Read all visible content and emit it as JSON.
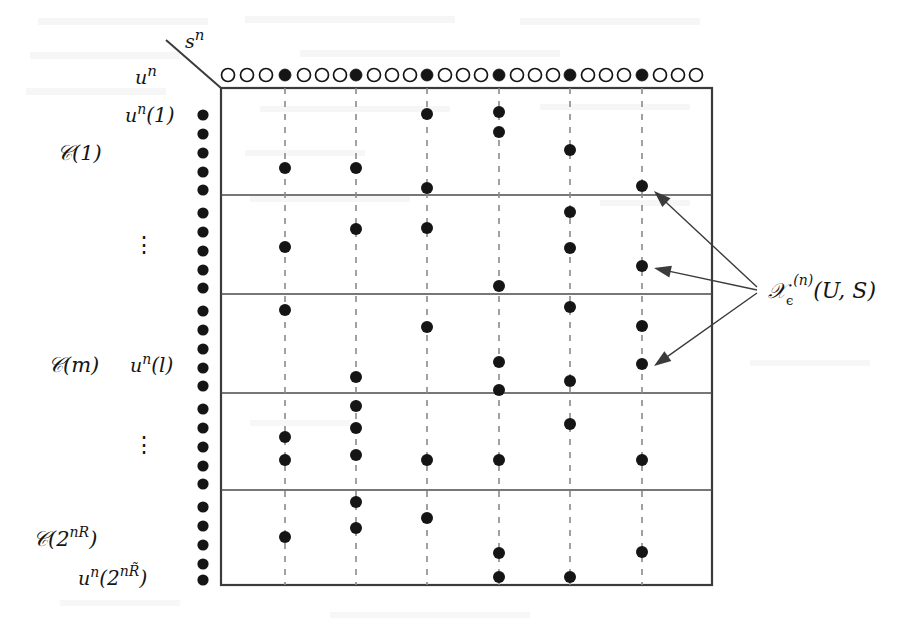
{
  "figure": {
    "axis_labels": {
      "horizontal": "s^n",
      "vertical": "u^n"
    },
    "row_labels": [
      {
        "id": "un-1",
        "text": "uⁿ(1)",
        "base": "u",
        "sup": "n",
        "arg": "(1)"
      },
      {
        "id": "c-1",
        "text": "𝒞(1)",
        "base": "C",
        "arg": "(1)"
      },
      {
        "id": "vdots-upper",
        "text": "⋮"
      },
      {
        "id": "c-m",
        "text": "𝒞(m)",
        "base": "C",
        "arg": "(m)"
      },
      {
        "id": "un-l",
        "text": "uⁿ(l)",
        "base": "u",
        "sup": "n",
        "arg": "(l)"
      },
      {
        "id": "vdots-lower",
        "text": "⋮"
      },
      {
        "id": "c-2nR",
        "text": "𝒞(2ⁿᴿ)",
        "base": "C",
        "arg": "(2^{nR})"
      },
      {
        "id": "un-2nRtilde",
        "text": "uⁿ(2ⁿᴿ̃)",
        "base": "u",
        "sup": "n",
        "arg": "(2^{nR̃})"
      }
    ],
    "annotation": {
      "id": "typical-set-label",
      "text": "𝒣ₑ⁽ⁿ⁾(U, S)",
      "symbol": "T",
      "subscript": "ϵ",
      "superscript": "(n)",
      "args": "(U, S)",
      "arrow_count": 3
    },
    "colors": {
      "ink": "#151515",
      "line": "#3b3b3b",
      "dashed": "#8a8a8a",
      "background": "#ffffff",
      "dot_fill": "#151515",
      "open_fill": "#ffffff"
    },
    "geometry": {
      "box": {
        "x": 221,
        "y": 88,
        "width": 491,
        "height": 497
      },
      "band_separators_y": [
        195,
        294,
        393,
        490
      ],
      "dashed_columns_x": [
        285,
        356,
        427,
        499,
        570,
        642
      ],
      "left_column_x": 203,
      "left_column_rows": 25,
      "top_row_y": 75,
      "top_row_count": 24,
      "top_row_pattern": "3 open then 1 filled, repeating",
      "dot_radius": 6,
      "open_radius": 6.5,
      "arrow_hub": {
        "x": 757,
        "y": 290
      }
    },
    "top_row_circles": [
      {
        "x": 228,
        "filled": false
      },
      {
        "x": 247,
        "filled": false
      },
      {
        "x": 266,
        "filled": false
      },
      {
        "x": 285,
        "filled": true
      },
      {
        "x": 304,
        "filled": false
      },
      {
        "x": 322,
        "filled": false
      },
      {
        "x": 340,
        "filled": false
      },
      {
        "x": 356,
        "filled": true
      },
      {
        "x": 374,
        "filled": false
      },
      {
        "x": 392,
        "filled": false
      },
      {
        "x": 410,
        "filled": false
      },
      {
        "x": 427,
        "filled": true
      },
      {
        "x": 445,
        "filled": false
      },
      {
        "x": 463,
        "filled": false
      },
      {
        "x": 481,
        "filled": false
      },
      {
        "x": 499,
        "filled": true
      },
      {
        "x": 517,
        "filled": false
      },
      {
        "x": 535,
        "filled": false
      },
      {
        "x": 553,
        "filled": false
      },
      {
        "x": 570,
        "filled": true
      },
      {
        "x": 588,
        "filled": false
      },
      {
        "x": 606,
        "filled": false
      },
      {
        "x": 624,
        "filled": false
      },
      {
        "x": 642,
        "filled": true
      },
      {
        "x": 660,
        "filled": false
      },
      {
        "x": 678,
        "filled": false
      },
      {
        "x": 696,
        "filled": false
      }
    ],
    "left_column_dots_y": [
      115,
      134,
      153,
      172,
      190,
      213,
      232,
      251,
      270,
      288,
      311,
      330,
      349,
      368,
      386,
      409,
      428,
      447,
      466,
      484,
      507,
      526,
      545,
      564,
      580
    ],
    "grid_dots": [
      {
        "x": 285,
        "y": 168
      },
      {
        "x": 285,
        "y": 247
      },
      {
        "x": 285,
        "y": 310
      },
      {
        "x": 285,
        "y": 437
      },
      {
        "x": 285,
        "y": 460
      },
      {
        "x": 285,
        "y": 537
      },
      {
        "x": 356,
        "y": 168
      },
      {
        "x": 356,
        "y": 229
      },
      {
        "x": 356,
        "y": 377
      },
      {
        "x": 356,
        "y": 406
      },
      {
        "x": 356,
        "y": 428
      },
      {
        "x": 356,
        "y": 455
      },
      {
        "x": 356,
        "y": 502
      },
      {
        "x": 356,
        "y": 528
      },
      {
        "x": 427,
        "y": 114
      },
      {
        "x": 427,
        "y": 188
      },
      {
        "x": 427,
        "y": 228
      },
      {
        "x": 427,
        "y": 327
      },
      {
        "x": 427,
        "y": 460
      },
      {
        "x": 427,
        "y": 518
      },
      {
        "x": 499,
        "y": 112
      },
      {
        "x": 499,
        "y": 132
      },
      {
        "x": 499,
        "y": 286
      },
      {
        "x": 499,
        "y": 362
      },
      {
        "x": 499,
        "y": 390
      },
      {
        "x": 499,
        "y": 460
      },
      {
        "x": 499,
        "y": 553
      },
      {
        "x": 499,
        "y": 577
      },
      {
        "x": 570,
        "y": 150
      },
      {
        "x": 570,
        "y": 212
      },
      {
        "x": 570,
        "y": 248
      },
      {
        "x": 570,
        "y": 307
      },
      {
        "x": 570,
        "y": 381
      },
      {
        "x": 570,
        "y": 424
      },
      {
        "x": 570,
        "y": 577
      },
      {
        "x": 642,
        "y": 186
      },
      {
        "x": 642,
        "y": 266
      },
      {
        "x": 642,
        "y": 326
      },
      {
        "x": 642,
        "y": 364
      },
      {
        "x": 642,
        "y": 460
      },
      {
        "x": 642,
        "y": 552
      }
    ],
    "arrows": [
      {
        "id": "arrow-top",
        "tip_x": 654,
        "tip_y": 191,
        "from_x": 757,
        "from_y": 287
      },
      {
        "id": "arrow-middle",
        "tip_x": 654,
        "tip_y": 268,
        "from_x": 757,
        "from_y": 290
      },
      {
        "id": "arrow-bottom",
        "tip_x": 654,
        "tip_y": 366,
        "from_x": 757,
        "from_y": 293
      }
    ],
    "diagonal_axis": {
      "x1": 166,
      "y1": 40,
      "x2": 221,
      "y2": 88
    }
  }
}
